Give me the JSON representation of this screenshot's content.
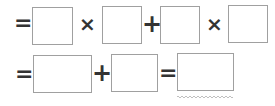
{
  "equation": {
    "row1": {
      "lead_operator": "=",
      "op1": "×",
      "op2": "+",
      "op3": "×",
      "boxes": [
        "",
        "",
        "",
        ""
      ]
    },
    "row2": {
      "lead_operator": "=",
      "op1": "+",
      "op2": "=",
      "boxes": [
        "",
        "",
        ""
      ]
    }
  },
  "colors": {
    "operator": "#333333",
    "box_border": "#a0a0a0",
    "wavy_underline": "#b0b0b0"
  }
}
